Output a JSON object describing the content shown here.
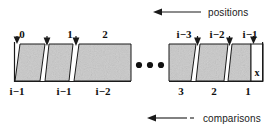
{
  "figure": {
    "kind": "array-diagram",
    "top_axis": {
      "label": "positions",
      "arrow_direction": "left",
      "arrow_icon": "arrow-left-icon"
    },
    "bottom_axis": {
      "label": "comparisons",
      "arrow_direction": "left",
      "arrow_icon": "arrow-left-dashed-icon"
    },
    "cell_marker": "x",
    "ellipsis": "•••",
    "top_indices": [
      {
        "label": "0",
        "x": 22
      },
      {
        "label": "1",
        "x": 70
      },
      {
        "label": "2",
        "x": 105
      },
      {
        "label": "i−3",
        "x": 184
      },
      {
        "label": "i−2",
        "x": 217
      },
      {
        "label": "i−1",
        "x": 250
      }
    ],
    "bottom_indices": [
      {
        "label": "i−1",
        "x": 17
      },
      {
        "label": "i−1",
        "x": 64
      },
      {
        "label": "i−2",
        "x": 103
      },
      {
        "label": "3",
        "x": 181
      },
      {
        "label": "2",
        "x": 214
      },
      {
        "label": "1",
        "x": 248
      }
    ],
    "colors": {
      "fill": "#c9c9c9",
      "stroke": "#1a1a1a",
      "text": "#111111",
      "background": "#ffffff"
    }
  }
}
